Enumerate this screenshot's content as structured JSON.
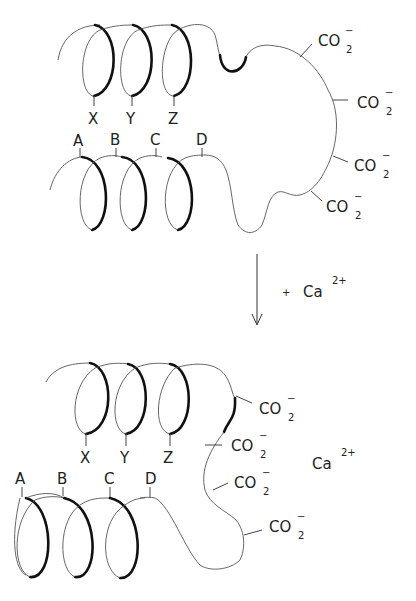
{
  "diagram": {
    "type": "calcium-binding conformational change (helix-loop-helix)",
    "top_state": {
      "helix_upper_labels": [
        "X",
        "Y",
        "Z"
      ],
      "helix_lower_labels": [
        "A",
        "B",
        "C",
        "D"
      ],
      "loop_groups": [
        {
          "formula": "CO",
          "subscript": "2",
          "charge": "−"
        },
        {
          "formula": "CO",
          "subscript": "2",
          "charge": "−"
        },
        {
          "formula": "CO",
          "subscript": "2",
          "charge": "−"
        },
        {
          "formula": "CO",
          "subscript": "2",
          "charge": "−"
        }
      ]
    },
    "transition": {
      "arrow": "down-arrow",
      "plus": "+",
      "ion": "Ca",
      "ion_charge": "2+"
    },
    "bottom_state": {
      "helix_upper_labels": [
        "X",
        "Y",
        "Z"
      ],
      "helix_lower_labels": [
        "A",
        "B",
        "C",
        "D"
      ],
      "loop_groups": [
        {
          "formula": "CO",
          "subscript": "2",
          "charge": "−"
        },
        {
          "formula": "CO",
          "subscript": "2",
          "charge": "−"
        },
        {
          "formula": "CO",
          "subscript": "2",
          "charge": "−"
        },
        {
          "formula": "CO",
          "subscript": "2",
          "charge": "−"
        }
      ],
      "bound_ion": "Ca",
      "bound_ion_charge": "2+"
    }
  }
}
